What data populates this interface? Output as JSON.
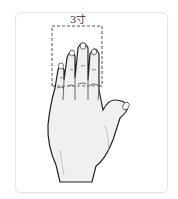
{
  "figure": {
    "measure_label": "3寸",
    "colors": {
      "outline": "#222222",
      "skin": "#f0f0f0",
      "dash": "#555555",
      "border": "#e6e6e6"
    }
  }
}
